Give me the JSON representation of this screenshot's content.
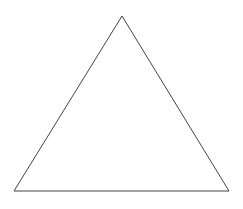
{
  "diagram": {
    "shape": "triangle",
    "kind": "equilateral-outline",
    "stroke_color": "#444444",
    "fill_color": "none",
    "background_color": "#ffffff",
    "stroke_width": 1,
    "vertices": [
      {
        "name": "apex",
        "x": 122,
        "y": 16
      },
      {
        "name": "bottom-left",
        "x": 14,
        "y": 191
      },
      {
        "name": "bottom-right",
        "x": 229,
        "y": 191
      }
    ]
  }
}
